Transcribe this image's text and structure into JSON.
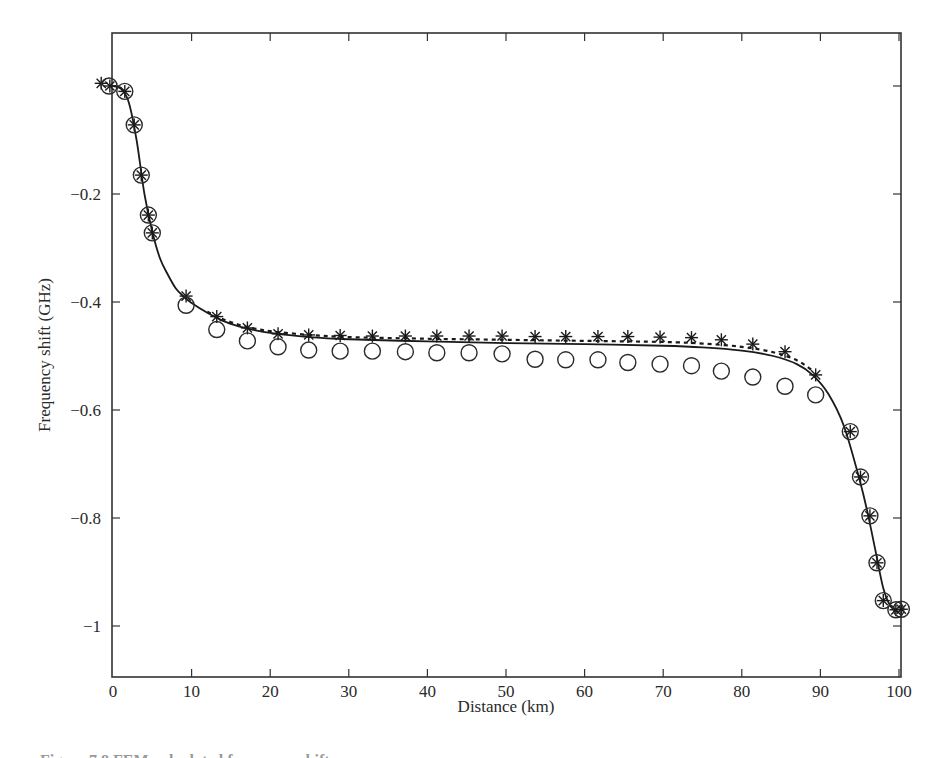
{
  "chart_data": {
    "type": "scatter",
    "title": "",
    "xlabel": "Distance (km)",
    "ylabel": "Frequency shift (GHz)",
    "xlim": [
      0,
      100.4
    ],
    "ylim": [
      -1.094,
      0.098
    ],
    "grid": false,
    "legend": null,
    "x_ticks": [
      0,
      10,
      20,
      30,
      40,
      50,
      60,
      70,
      80,
      90,
      100
    ],
    "x_tick_labels": [
      "0",
      "10",
      "20",
      "30",
      "40",
      "50",
      "60",
      "70",
      "80",
      "90",
      "100"
    ],
    "y_ticks": [
      -0.2,
      -0.4,
      -0.6,
      -0.8,
      -1
    ],
    "y_tick_labels": [
      "−0.2",
      "−0.4",
      "−0.6",
      "−0.8",
      "−1"
    ],
    "extra_y_ticks_unlabeled": [
      0
    ],
    "series": [
      {
        "name": "stars",
        "marker": "asterisk",
        "x": [
          -1.5,
          -0.4,
          1.5,
          2.7,
          3.6,
          4.5,
          5.0,
          9.3,
          13.2,
          17.1,
          21.0,
          24.9,
          28.9,
          33.0,
          37.2,
          41.2,
          45.3,
          49.5,
          53.7,
          57.6,
          61.7,
          65.5,
          69.6,
          73.6,
          77.4,
          81.4,
          85.5,
          89.4,
          93.8,
          95.1,
          96.3,
          97.2,
          98.0,
          99.6,
          100.3
        ],
        "y": [
          0.005,
          0.0,
          -0.01,
          -0.072,
          -0.165,
          -0.239,
          -0.272,
          -0.389,
          -0.427,
          -0.448,
          -0.459,
          -0.461,
          -0.462,
          -0.463,
          -0.463,
          -0.463,
          -0.463,
          -0.463,
          -0.464,
          -0.464,
          -0.464,
          -0.464,
          -0.465,
          -0.466,
          -0.47,
          -0.478,
          -0.492,
          -0.535,
          -0.64,
          -0.724,
          -0.796,
          -0.883,
          -0.953,
          -0.97,
          -0.969
        ]
      },
      {
        "name": "circles",
        "marker": "circle",
        "x": [
          -0.5,
          1.5,
          2.7,
          3.6,
          4.5,
          5.0,
          9.3,
          13.2,
          17.1,
          21.0,
          24.9,
          28.9,
          33.0,
          37.2,
          41.2,
          45.3,
          49.5,
          53.7,
          57.6,
          61.7,
          65.5,
          69.6,
          73.6,
          77.4,
          81.4,
          85.5,
          89.4,
          93.8,
          95.1,
          96.3,
          97.2,
          98.0,
          99.6,
          100.3
        ],
        "y": [
          0.0,
          -0.01,
          -0.072,
          -0.165,
          -0.239,
          -0.272,
          -0.406,
          -0.451,
          -0.472,
          -0.483,
          -0.489,
          -0.491,
          -0.491,
          -0.492,
          -0.494,
          -0.494,
          -0.496,
          -0.506,
          -0.507,
          -0.507,
          -0.512,
          -0.515,
          -0.518,
          -0.528,
          -0.539,
          -0.556,
          -0.572,
          -0.64,
          -0.724,
          -0.796,
          -0.883,
          -0.953,
          -0.97,
          -0.969
        ]
      },
      {
        "name": "solid-curve",
        "style": "solid",
        "x": [
          0,
          1,
          2,
          3,
          4,
          5,
          6,
          7,
          8,
          9,
          10,
          12,
          14,
          16,
          18,
          20,
          25,
          30,
          40,
          50,
          60,
          70,
          75,
          80,
          84,
          87,
          89,
          91,
          93,
          95,
          96,
          97,
          98,
          99,
          100
        ],
        "y": [
          0.0,
          -0.005,
          -0.03,
          -0.1,
          -0.2,
          -0.27,
          -0.32,
          -0.35,
          -0.375,
          -0.39,
          -0.402,
          -0.42,
          -0.435,
          -0.445,
          -0.452,
          -0.457,
          -0.465,
          -0.469,
          -0.473,
          -0.476,
          -0.478,
          -0.481,
          -0.484,
          -0.49,
          -0.5,
          -0.515,
          -0.535,
          -0.57,
          -0.63,
          -0.73,
          -0.79,
          -0.86,
          -0.93,
          -0.965,
          -0.975
        ]
      },
      {
        "name": "dashed-curve",
        "style": "dashed",
        "x": [
          12,
          14,
          16,
          18,
          20,
          25,
          30,
          40,
          50,
          60,
          70,
          75,
          80,
          84,
          87,
          89
        ],
        "y": [
          -0.418,
          -0.432,
          -0.442,
          -0.449,
          -0.454,
          -0.461,
          -0.465,
          -0.468,
          -0.47,
          -0.472,
          -0.474,
          -0.477,
          -0.483,
          -0.493,
          -0.508,
          -0.527
        ]
      }
    ]
  },
  "caption": "Figure 7.8  FEM-calculated frequency shift..."
}
